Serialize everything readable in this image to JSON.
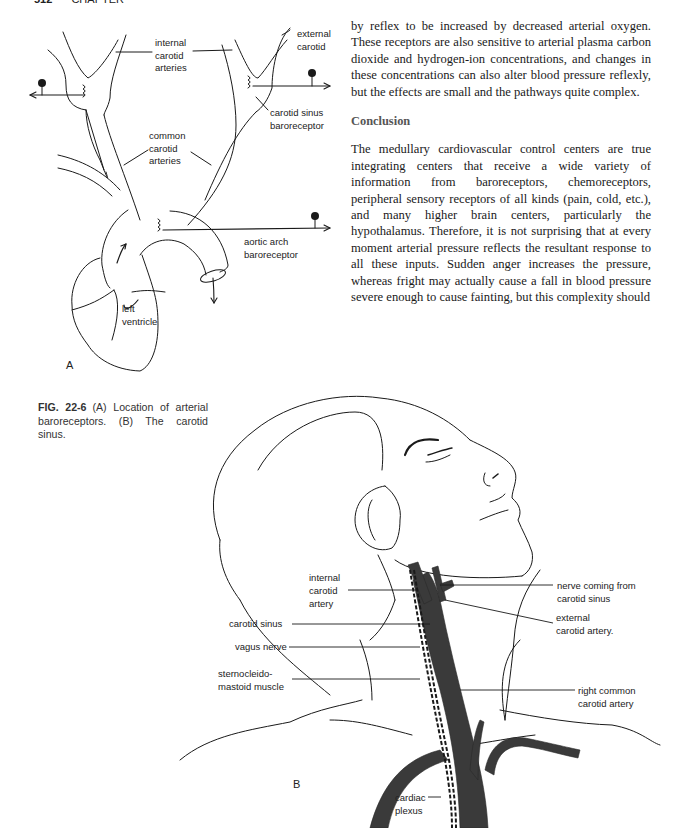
{
  "page_header": {
    "page_number": "512",
    "running_title": "CHAPTER"
  },
  "figure": {
    "number": "FIG. 22-6",
    "caption": "(A) Location of arterial baroreceptors. (B) The carotid sinus.",
    "panel_a": {
      "letter": "A",
      "labels": {
        "internal_carotid_arteries": "internal\ncarotid\narteries",
        "external_carotid": "external\ncarotid",
        "carotid_sinus_baroreceptor": "carotid sinus\nbaroreceptor",
        "common_carotid_arteries": "common\ncarotid\narteries",
        "aortic_arch_baroreceptor": "aortic arch\nbaroreceptor",
        "left_ventricle": "left\nventricle"
      }
    },
    "panel_b": {
      "letter": "B",
      "labels": {
        "internal_carotid_artery": "internal\ncarotid\nartery",
        "carotid_sinus": "carotid sinus",
        "vagus_nerve": "vagus nerve",
        "sternocleidomastoid_muscle": "sternocleido-\nmastoid muscle",
        "nerve_from_carotid_sinus": "nerve coming from\ncarotid sinus",
        "external_carotid_artery": "external\ncarotid artery.",
        "right_common_carotid_artery": "right common\ncarotid artery",
        "cardiac_plexus": "cardiac\nplexus"
      }
    }
  },
  "body_text": {
    "paragraph_1": "by reflex to be increased by decreased arterial oxygen. These receptors are also sensitive to arterial plasma carbon dioxide and hydrogen-ion concentrations, and changes in these concentrations can also alter blood pressure reflexly, but the effects are small and the pathways quite complex.",
    "heading": "Conclusion",
    "paragraph_2": "The medullary cardiovascular control centers are true integrating centers that receive a wide variety of information from baroreceptors, chemoreceptors, peripheral sensory receptors of all kinds (pain, cold, etc.), and many higher brain centers, particularly the hypothalamus. Therefore, it is not surprising that at every moment arterial pressure reflects the resultant response to all these inputs. Sudden anger increases the pressure, whereas fright may actually cause a fall in blood pressure severe enough to cause fainting, but this complexity should"
  },
  "colors": {
    "ink": "#1a1a1a",
    "artery_fill": "#3a3a3a",
    "caption_text": "#333333",
    "heading_text": "#555555"
  }
}
